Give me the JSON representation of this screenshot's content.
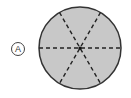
{
  "figure": {
    "option_label": "A",
    "shape": "circle",
    "sectors": 6,
    "fill_color": "#c8c8c8",
    "stroke_color": "#333333",
    "divider_style": "dashed",
    "center": [
      80,
      48
    ],
    "radius": 41,
    "divider_angles_deg": [
      0,
      60,
      120
    ]
  }
}
